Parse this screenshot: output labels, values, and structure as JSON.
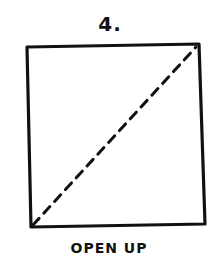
{
  "step": {
    "number": "4."
  },
  "diagram": {
    "shape": "square",
    "fold_line": "diagonal-dashed",
    "fold_from": "bottom-left",
    "fold_to": "top-right",
    "stroke_color": "#111111"
  },
  "caption": {
    "text": "OPEN UP"
  }
}
